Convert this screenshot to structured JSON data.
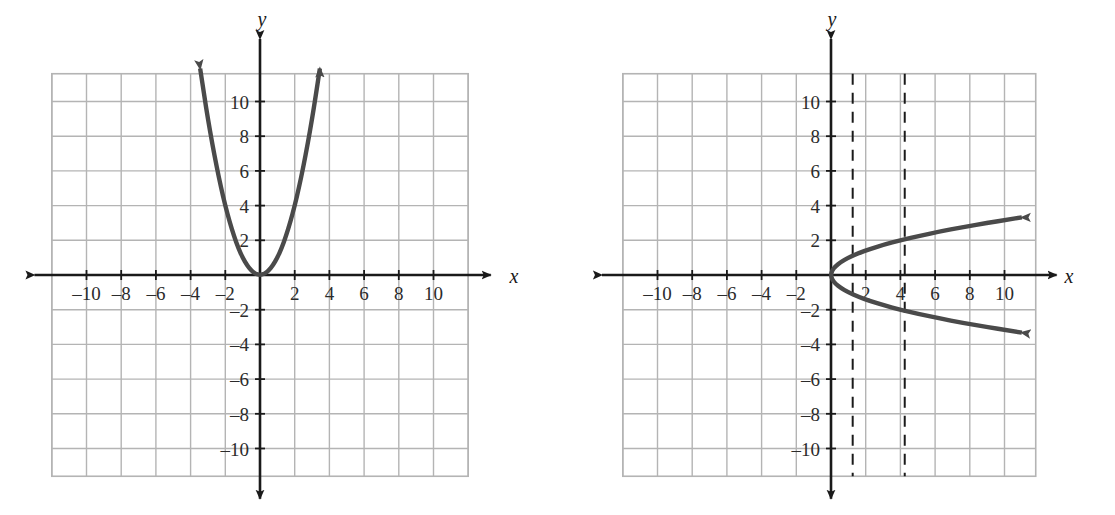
{
  "figure": {
    "background_color": "#ffffff",
    "grid_color": "#b4b4b4",
    "axis_color": "#1a1a1a",
    "curve_color": "#4a4a4a",
    "dashed_color": "#1a1a1a",
    "panels": 2
  },
  "chart_data": [
    {
      "id": "left-graph",
      "type": "line",
      "title": "",
      "subtitle": "",
      "xlabel": "x",
      "ylabel": "y",
      "xlim": [
        -12,
        12
      ],
      "ylim": [
        -12,
        12
      ],
      "grid": true,
      "grid_step": 2,
      "legend": "none",
      "x_ticks": [
        -10,
        -8,
        -6,
        -4,
        -2,
        2,
        4,
        6,
        8,
        10
      ],
      "x_tick_labels": [
        "–10",
        "–8",
        "–6",
        "–4",
        "–2",
        "2",
        "4",
        "6",
        "8",
        "10"
      ],
      "y_ticks": [
        10,
        8,
        6,
        4,
        2,
        -2,
        -4,
        -6,
        -8,
        -10
      ],
      "y_tick_labels": [
        "10",
        "8",
        "6",
        "4",
        "2",
        "–2",
        "–4",
        "–6",
        "–8",
        "–10"
      ],
      "series": [
        {
          "name": "y = x squared",
          "equation": "y = x^2",
          "orientation": "opens-up",
          "vertex": [
            0,
            0
          ],
          "arrow_start": true,
          "arrow_end": true,
          "points": [
            [
              -3.45,
              11.9
            ],
            [
              -3.2,
              10.24
            ],
            [
              -3.0,
              9.0
            ],
            [
              -2.75,
              7.5625
            ],
            [
              -2.5,
              6.25
            ],
            [
              -2.25,
              5.0625
            ],
            [
              -2.0,
              4.0
            ],
            [
              -1.75,
              3.0625
            ],
            [
              -1.5,
              2.25
            ],
            [
              -1.25,
              1.5625
            ],
            [
              -1.0,
              1.0
            ],
            [
              -0.75,
              0.5625
            ],
            [
              -0.5,
              0.25
            ],
            [
              -0.25,
              0.0625
            ],
            [
              0,
              0
            ],
            [
              0.25,
              0.0625
            ],
            [
              0.5,
              0.25
            ],
            [
              0.75,
              0.5625
            ],
            [
              1.0,
              1.0
            ],
            [
              1.25,
              1.5625
            ],
            [
              1.5,
              2.25
            ],
            [
              1.75,
              3.0625
            ],
            [
              2.0,
              4.0
            ],
            [
              2.25,
              5.0625
            ],
            [
              2.5,
              6.25
            ],
            [
              2.75,
              7.5625
            ],
            [
              3.0,
              9.0
            ],
            [
              3.2,
              10.24
            ],
            [
              3.45,
              11.9
            ]
          ]
        }
      ],
      "dashed_lines": []
    },
    {
      "id": "right-graph",
      "type": "line",
      "title": "",
      "subtitle": "",
      "xlabel": "x",
      "ylabel": "y",
      "xlim": [
        -12,
        12
      ],
      "ylim": [
        -12,
        12
      ],
      "grid": true,
      "grid_step": 2,
      "legend": "none",
      "x_ticks": [
        -10,
        -8,
        -6,
        -4,
        -2,
        2,
        4,
        6,
        8,
        10
      ],
      "x_tick_labels": [
        "–10",
        "–8",
        "–6",
        "–4",
        "–2",
        "2",
        "4",
        "6",
        "8",
        "10"
      ],
      "y_ticks": [
        10,
        8,
        6,
        4,
        2,
        -2,
        -4,
        -6,
        -8,
        -10
      ],
      "y_tick_labels": [
        "10",
        "8",
        "6",
        "4",
        "2",
        "–2",
        "–4",
        "–6",
        "–8",
        "–10"
      ],
      "series": [
        {
          "name": "x = y squared",
          "equation": "x = y^2",
          "orientation": "opens-right",
          "vertex": [
            0,
            0
          ],
          "arrow_start": true,
          "arrow_end": true,
          "points": [
            [
              11.0,
              -3.32
            ],
            [
              10.24,
              -3.2
            ],
            [
              9.0,
              -3.0
            ],
            [
              7.5625,
              -2.75
            ],
            [
              6.25,
              -2.5
            ],
            [
              5.0625,
              -2.25
            ],
            [
              4.0,
              -2.0
            ],
            [
              3.0625,
              -1.75
            ],
            [
              2.25,
              -1.5
            ],
            [
              1.5625,
              -1.25
            ],
            [
              1.0,
              -1.0
            ],
            [
              0.5625,
              -0.75
            ],
            [
              0.25,
              -0.5
            ],
            [
              0.0625,
              -0.25
            ],
            [
              0,
              0
            ],
            [
              0.0625,
              0.25
            ],
            [
              0.25,
              0.5
            ],
            [
              0.5625,
              0.75
            ],
            [
              1.0,
              1.0
            ],
            [
              1.5625,
              1.25
            ],
            [
              2.25,
              1.5
            ],
            [
              3.0625,
              1.75
            ],
            [
              4.0,
              2.0
            ],
            [
              5.0625,
              2.25
            ],
            [
              6.25,
              2.5
            ],
            [
              7.5625,
              2.75
            ],
            [
              9.0,
              3.0
            ],
            [
              10.24,
              3.2
            ],
            [
              11.0,
              3.32
            ]
          ]
        }
      ],
      "dashed_lines": [
        {
          "name": "vertical-line-test-1",
          "orientation": "vertical",
          "x": 1.25
        },
        {
          "name": "vertical-line-test-2",
          "orientation": "vertical",
          "x": 4.25
        }
      ]
    }
  ]
}
